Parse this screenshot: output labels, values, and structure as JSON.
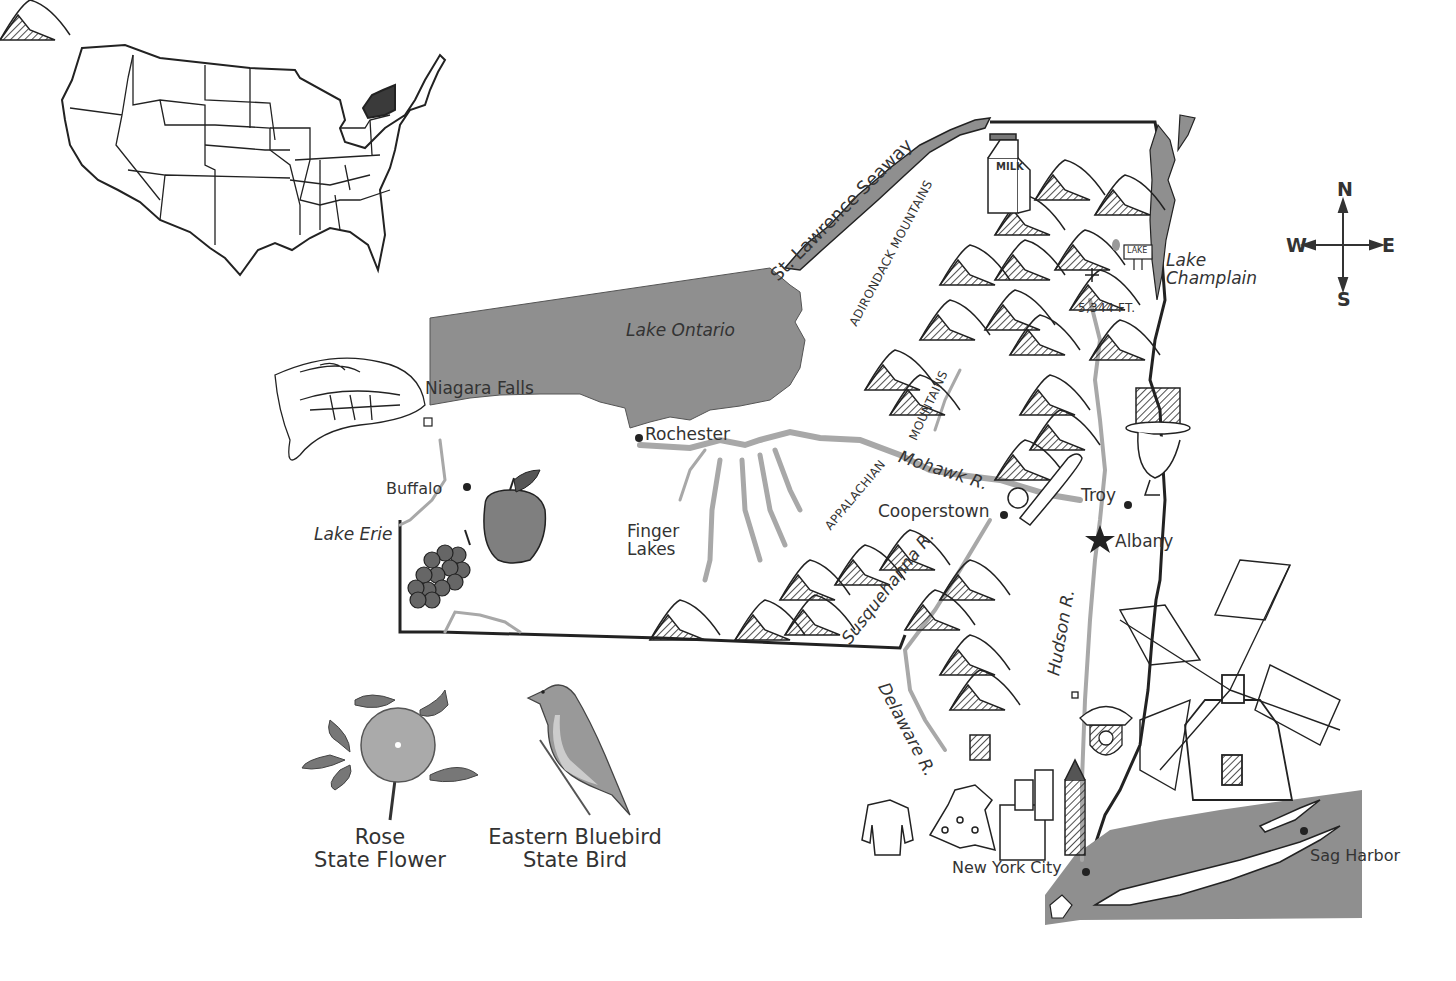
{
  "inset": {
    "name": "us-locator-map",
    "highlighted_state": "New York",
    "highlight_color": "#3a3a3a"
  },
  "compass": {
    "n": "N",
    "s": "S",
    "e": "E",
    "w": "W"
  },
  "water_color": "#8f8f8f",
  "river_color": "#a8a8a8",
  "labels": {
    "st_lawrence": "St. Lawrence Seaway",
    "adirondack": "ADIRONDACK MOUNTAINS",
    "lake_champlain_1": "Lake",
    "lake_champlain_2": "Champlain",
    "elevation": "5,344 FT.",
    "lake_sign": "LAKE",
    "milk": "MILK",
    "lake_ontario": "Lake Ontario",
    "niagara_falls": "Niagara Falls",
    "rochester": "Rochester",
    "buffalo": "Buffalo",
    "lake_erie": "Lake Erie",
    "finger_lakes_1": "Finger",
    "finger_lakes_2": "Lakes",
    "mountains": "MOUNTAINS",
    "appalachian": "APPALACHIAN",
    "mohawk": "Mohawk R.",
    "cooperstown": "Cooperstown",
    "troy": "Troy",
    "albany": "Albany",
    "susquehanna": "Susquehanna R.",
    "hudson": "Hudson R.",
    "delaware": "Delaware R.",
    "nyc": "New York City",
    "sag_harbor": "Sag Harbor"
  },
  "symbols": {
    "flower_name": "Rose",
    "flower_title": "State Flower",
    "bird_name": "Eastern Bluebird",
    "bird_title": "State Bird"
  },
  "cities": [
    {
      "name": "Rochester",
      "marker": "dot"
    },
    {
      "name": "Buffalo",
      "marker": "dot"
    },
    {
      "name": "Niagara Falls",
      "marker": "square"
    },
    {
      "name": "Cooperstown",
      "marker": "dot"
    },
    {
      "name": "Troy",
      "marker": "dot"
    },
    {
      "name": "Albany",
      "marker": "star",
      "capital": true
    },
    {
      "name": "New York City",
      "marker": "dot"
    },
    {
      "name": "Sag Harbor",
      "marker": "dot"
    }
  ]
}
